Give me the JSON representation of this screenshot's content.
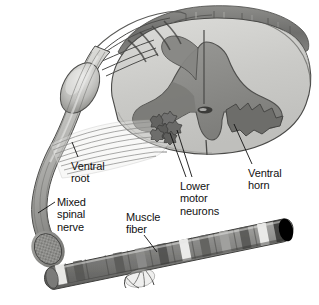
{
  "figure": {
    "type": "anatomical-illustration",
    "style": "grayscale halftone medical illustration",
    "width": 319,
    "height": 305,
    "background_color": "#ffffff"
  },
  "labels": {
    "ventral_root": "Ventral\nroot",
    "mixed_spinal_nerve": "Mixed\nspinal\nnerve",
    "muscle_fiber": "Muscle\nfiber",
    "lower_motor_neurons": "Lower\nmotor\nneurons",
    "ventral_horn": "Ventral\nhorn"
  },
  "colors": {
    "ink": "#111111",
    "outline": "#3a3a3a",
    "white_matter": "#c9c9c6",
    "white_matter_light": "#d8d8d5",
    "gray_matter": "#8e8e8b",
    "gray_matter_dark": "#6f6f6d",
    "dorsal_column": "#7c7c7a",
    "nerve_light": "#d2d2cf",
    "nerve_mid": "#a8a8a5",
    "nerve_dark": "#6a6a68",
    "muscle_dark": "#5f5f5d",
    "muscle_band_light": "#f2f2f0",
    "muscle_mid": "#909090",
    "leader_line": "#1a1a1a",
    "background": "#ffffff"
  },
  "structures": [
    {
      "name": "spinal-cord-cross-section",
      "description": "Butterfly-shaped gray matter surrounded by white matter, cut transverse face"
    },
    {
      "name": "dorsal-columns",
      "description": "Ridged dorsal white matter columns at top of cord"
    },
    {
      "name": "dorsal-rootlets",
      "description": "Fan of rootlets entering dorsolateral cord surface"
    },
    {
      "name": "dorsal-root-ganglion",
      "description": "Swollen oval enlargement on the dorsal root"
    },
    {
      "name": "central-canal",
      "description": "Small dark oval at the center of the gray commissure"
    },
    {
      "name": "ventral-horn-left",
      "description": "Anterior gray horn containing motor neuron cell bodies"
    },
    {
      "name": "ventral-horn-right",
      "description": "Jagged anterior gray horn on the right side"
    },
    {
      "name": "lower-motor-neuron-cluster",
      "description": "Cluster of star-shaped multipolar cell bodies in the ventral horn"
    },
    {
      "name": "ventral-root-fibers",
      "description": "Fan of motor axons leaving the ventral horn"
    },
    {
      "name": "mixed-spinal-nerve",
      "description": "Converged nerve trunk with cut speckled fascicular end"
    },
    {
      "name": "motor-axon",
      "description": "Single thin axon running from spinal nerve to muscle"
    },
    {
      "name": "muscle-fiber",
      "description": "Striated skeletal muscle fiber cylinder with alternating light and dark bands"
    },
    {
      "name": "neuromuscular-junction",
      "description": "Branching terminal twigs of the axon on the muscle fiber surface"
    }
  ]
}
